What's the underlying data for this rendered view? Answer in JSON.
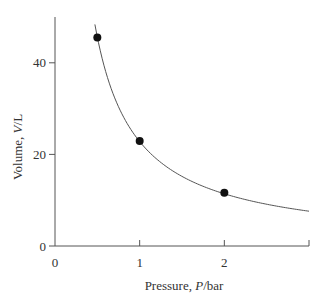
{
  "chart_data": {
    "type": "scatter",
    "title": "",
    "xlabel": "Pressure, P/bar",
    "ylabel": "Volume, V/L",
    "xlabel_parts": {
      "prefix": "Pressure, ",
      "var": "P",
      "suffix": "/bar"
    },
    "ylabel_parts": {
      "prefix": "Volume, ",
      "var": "V",
      "suffix": "/L"
    },
    "xlim": [
      0,
      3
    ],
    "ylim": [
      0,
      50
    ],
    "xticks": [
      0,
      1,
      2
    ],
    "yticks": [
      0,
      20,
      40
    ],
    "grid": false,
    "legend": null,
    "series": [
      {
        "name": "measured",
        "kind": "points",
        "x": [
          0.5,
          1,
          2
        ],
        "y": [
          45.5,
          22.9,
          11.6
        ]
      },
      {
        "name": "fit V = k/P",
        "kind": "curve",
        "k": 22.8,
        "x_range": [
          0.45,
          3
        ]
      }
    ],
    "colors": {
      "points": "#111111",
      "curve": "#555555",
      "axes": "#555555"
    }
  }
}
